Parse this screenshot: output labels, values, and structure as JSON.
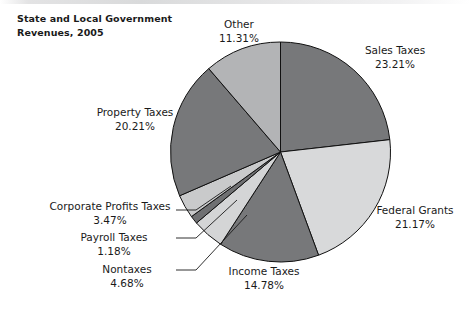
{
  "chart_data": {
    "type": "pie",
    "title": "State and Local Government\nRevenues, 2005",
    "xlabel": "",
    "ylabel": "",
    "legend_position": "none",
    "grid": false,
    "start_angle_deg": 0,
    "direction": "clockwise",
    "categories": [
      "Sales Taxes",
      "Federal Grants",
      "Income Taxes",
      "Nontaxes",
      "Payroll Taxes",
      "Corporate Profits Taxes",
      "Property Taxes",
      "Other"
    ],
    "values": [
      23.21,
      21.17,
      14.78,
      4.68,
      1.18,
      3.47,
      20.21,
      11.31
    ],
    "value_unit": "%",
    "slices": [
      {
        "label": "Sales Taxes",
        "value": 23.21,
        "value_text": "23.21%",
        "color": "#77787a"
      },
      {
        "label": "Federal Grants",
        "value": 21.17,
        "value_text": "21.17%",
        "color": "#d8d9da"
      },
      {
        "label": "Income Taxes",
        "value": 14.78,
        "value_text": "14.78%",
        "color": "#77787a"
      },
      {
        "label": "Nontaxes",
        "value": 4.68,
        "value_text": "4.68%",
        "color": "#d4d5d6"
      },
      {
        "label": "Payroll Taxes",
        "value": 1.18,
        "value_text": "1.18%",
        "color": "#6f7072"
      },
      {
        "label": "Corporate Profits Taxes",
        "value": 3.47,
        "value_text": "3.47%",
        "color": "#c9cacb"
      },
      {
        "label": "Property Taxes",
        "value": 20.21,
        "value_text": "20.21%",
        "color": "#77787a"
      },
      {
        "label": "Other",
        "value": 11.31,
        "value_text": "11.31%",
        "color": "#b3b4b6"
      }
    ]
  },
  "labels": {
    "sales": "Sales Taxes\n23.21%",
    "federal": "Federal Grants\n21.17%",
    "income": "Income Taxes\n14.78%",
    "nontaxes": "Nontaxes\n4.68%",
    "payroll": "Payroll Taxes\n1.18%",
    "corporate": "Corporate Profits Taxes\n3.47%",
    "property": "Property  Taxes\n20.21%",
    "other": "Other\n11.31%"
  },
  "colors": {
    "dark_slice": "#77787a",
    "light_slice": "#d8d9da",
    "medium_slice": "#b3b4b6",
    "outline": "#111111",
    "background": "#ffffff",
    "text": "#1a1a1a"
  }
}
